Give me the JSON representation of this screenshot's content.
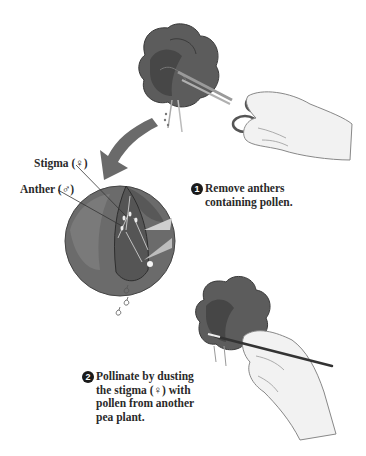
{
  "figure": {
    "labels": {
      "stigma": "Stigma (♀)",
      "anther": "Anther (♂)"
    },
    "steps": [
      {
        "number": "1",
        "lines": [
          "Remove anthers",
          "containing pollen."
        ]
      },
      {
        "number": "2",
        "lines": [
          "Pollinate by dusting",
          "the stigma (♀) with",
          "pollen from another",
          "pea plant."
        ]
      }
    ],
    "colors": {
      "petal": "#5a5a5a",
      "petal_dark": "#3e3e3e",
      "arrow": "#6a6a6a",
      "skin": "#ececec",
      "outline": "#444444"
    }
  }
}
